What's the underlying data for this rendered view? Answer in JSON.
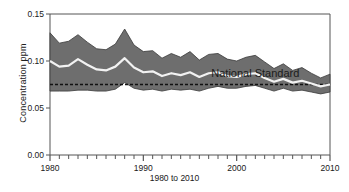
{
  "chart": {
    "title": "",
    "ylabel": "Concentration ppm",
    "xlabel": "1980 to 2010",
    "annotation": "National Standard",
    "colors": {
      "band": "#6e6e6e",
      "median_line": "#f2f2f2",
      "band_outline": "#3a3a3a",
      "standard_line": "#111111",
      "axis": "#555555",
      "background": "#ffffff"
    },
    "y_ticks": [
      "0.00",
      "0.05",
      "0.10",
      "0.15"
    ],
    "x_ticks": [
      "1980",
      "1990",
      "2000",
      "2010"
    ]
  },
  "chart_data": {
    "type": "area",
    "title": "",
    "xlabel": "1980 to 2010",
    "ylabel": "Concentration ppm",
    "xlim": [
      1980,
      2010
    ],
    "ylim": [
      0.0,
      0.15
    ],
    "ytick_values": [
      0.0,
      0.05,
      0.1,
      0.15
    ],
    "ytick_labels": [
      "0.00",
      "0.05",
      "0.10",
      "0.15"
    ],
    "xtick_values": [
      1980,
      1990,
      2000,
      2010
    ],
    "xtick_labels": [
      "1980",
      "1990",
      "2000",
      "2010"
    ],
    "minor_xtick_interval": 1,
    "grid": false,
    "legend": "none",
    "annotations": [
      {
        "text": "National Standard",
        "x": 2002.0,
        "y": 0.083
      }
    ],
    "x": [
      1980,
      1981,
      1982,
      1983,
      1984,
      1985,
      1986,
      1987,
      1988,
      1989,
      1990,
      1991,
      1992,
      1993,
      1994,
      1995,
      1996,
      1997,
      1998,
      1999,
      2000,
      2001,
      2002,
      2003,
      2004,
      2005,
      2006,
      2007,
      2008,
      2009,
      2010
    ],
    "series": [
      {
        "name": "90th percentile (band upper)",
        "values": [
          0.13,
          0.119,
          0.121,
          0.128,
          0.12,
          0.113,
          0.112,
          0.118,
          0.134,
          0.117,
          0.11,
          0.111,
          0.103,
          0.108,
          0.104,
          0.11,
          0.101,
          0.107,
          0.108,
          0.102,
          0.1,
          0.104,
          0.106,
          0.099,
          0.092,
          0.097,
          0.09,
          0.093,
          0.087,
          0.082,
          0.086
        ]
      },
      {
        "name": "Mean (white median line)",
        "values": [
          0.1,
          0.094,
          0.095,
          0.102,
          0.096,
          0.091,
          0.09,
          0.094,
          0.103,
          0.093,
          0.088,
          0.089,
          0.084,
          0.087,
          0.085,
          0.088,
          0.083,
          0.087,
          0.088,
          0.084,
          0.083,
          0.086,
          0.087,
          0.082,
          0.078,
          0.081,
          0.077,
          0.079,
          0.076,
          0.073,
          0.075
        ]
      },
      {
        "name": "10th percentile (band lower)",
        "values": [
          0.068,
          0.068,
          0.068,
          0.069,
          0.069,
          0.068,
          0.068,
          0.07,
          0.077,
          0.071,
          0.069,
          0.07,
          0.068,
          0.07,
          0.069,
          0.07,
          0.068,
          0.071,
          0.073,
          0.071,
          0.071,
          0.073,
          0.074,
          0.071,
          0.068,
          0.071,
          0.068,
          0.069,
          0.067,
          0.065,
          0.067
        ]
      },
      {
        "name": "National Standard",
        "style": "dashed",
        "values": [
          0.075,
          0.075,
          0.075,
          0.075,
          0.075,
          0.075,
          0.075,
          0.075,
          0.075,
          0.075,
          0.075,
          0.075,
          0.075,
          0.075,
          0.075,
          0.075,
          0.075,
          0.075,
          0.075,
          0.075,
          0.075,
          0.075,
          0.075,
          0.075,
          0.075,
          0.075,
          0.075,
          0.075,
          0.075,
          0.075,
          0.075
        ]
      }
    ]
  }
}
